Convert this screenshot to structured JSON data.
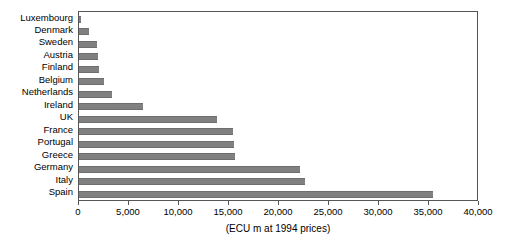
{
  "chart_data": {
    "type": "bar",
    "orientation": "horizontal",
    "title": "",
    "subtitle": "",
    "xlabel": "(ECU m at 1994 prices)",
    "ylabel": "",
    "xlim": [
      0,
      40000
    ],
    "xticks": [
      0,
      5000,
      10000,
      15000,
      20000,
      25000,
      30000,
      35000,
      40000
    ],
    "xtick_labels": [
      "0",
      "5,000",
      "10,000",
      "15,000",
      "20,000",
      "25,000",
      "30,000",
      "35,000",
      "40,000"
    ],
    "grid": false,
    "legend": false,
    "legend_position": "none",
    "bar_color": "#808080",
    "categories": [
      "Luxembourg",
      "Denmark",
      "Sweden",
      "Austria",
      "Finland",
      "Belgium",
      "Netherlands",
      "Ireland",
      "UK",
      "France",
      "Portugal",
      "Greece",
      "Germany",
      "Italy",
      "Spain"
    ],
    "values": [
      200,
      1000,
      1800,
      1900,
      2000,
      2500,
      3300,
      6400,
      13800,
      15400,
      15500,
      15600,
      22100,
      22600,
      35400
    ]
  }
}
